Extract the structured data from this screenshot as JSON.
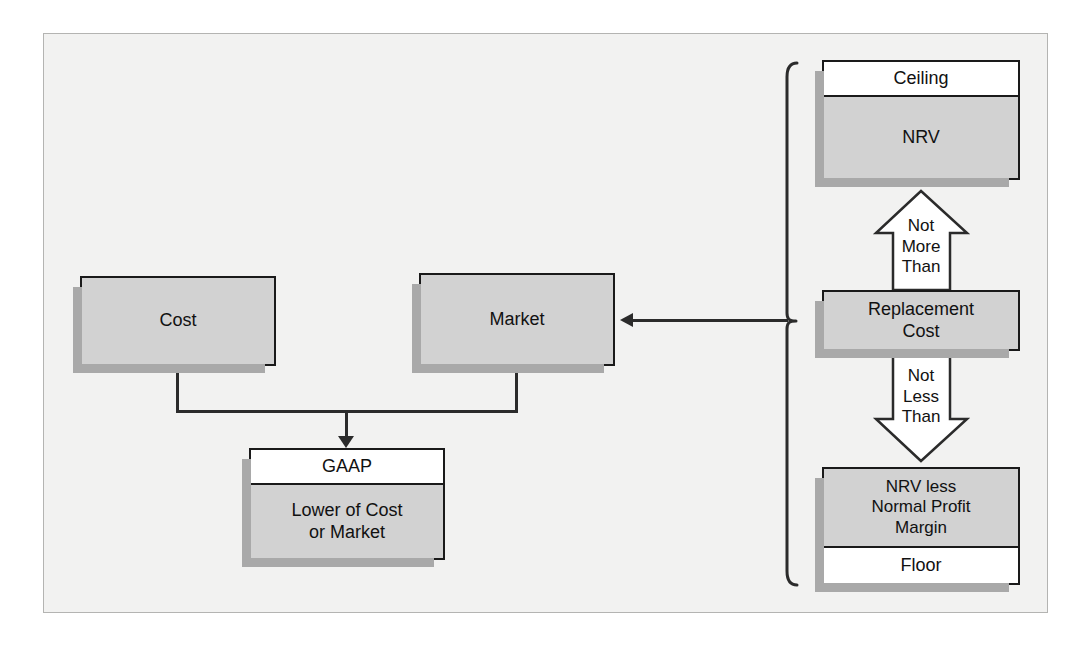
{
  "diagram": {
    "title": "Lower of Cost or Market",
    "colors": {
      "page_background": "#ffffff",
      "frame_background": "#f2f2f1",
      "frame_border": "#b4b4b2",
      "box_fill_gray": "#d2d2d2",
      "box_fill_white": "#ffffff",
      "box_border": "#1a1a1a",
      "box_shadow": "#a9a9a9",
      "connector": "#2b2b2b",
      "text": "#111111"
    },
    "nodes": {
      "cost": {
        "label": "Cost"
      },
      "market": {
        "label": "Market"
      },
      "gaap": {
        "header": "GAAP",
        "body": "Lower of Cost\nor Market",
        "body_line1": "Lower of Cost",
        "body_line2": "or Market"
      },
      "ceiling": {
        "header": "Ceiling",
        "body": "NRV"
      },
      "replacement": {
        "line1": "Replacement",
        "line2": "Cost"
      },
      "floor": {
        "body_line1": "NRV less",
        "body_line2": "Normal Profit",
        "body_line3": "Margin",
        "footer": "Floor"
      }
    },
    "arrows": {
      "up": {
        "line1": "Not",
        "line2": "More",
        "line3": "Than"
      },
      "down": {
        "line1": "Not",
        "line2": "Less",
        "line3": "Than"
      }
    }
  }
}
